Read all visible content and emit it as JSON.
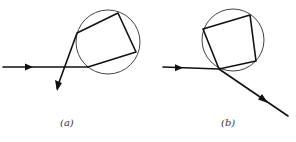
{
  "figure": {
    "panels": [
      {
        "id": "a",
        "caption": "(a)",
        "description": "Ray enters circle, reflects inside along quadrilateral path, exits crossing incoming ray"
      },
      {
        "id": "b",
        "caption": "(b)",
        "description": "Ray enters circle, reflects inside along quadrilateral path, exits downward to the right"
      }
    ],
    "colors": {
      "ray": "#111111",
      "circle": "#444444",
      "background": "#ffffff"
    }
  }
}
